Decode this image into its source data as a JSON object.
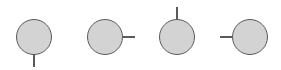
{
  "diagram": {
    "title": "",
    "fill_color": "#d3d3d3",
    "stroke_color": "#5a5a5a",
    "background": "#ffffff",
    "nodes": [
      {
        "id": "pin-bottom",
        "shape": "circle",
        "cx": 34,
        "cy": 37,
        "r": 18,
        "stick_direction": "down"
      },
      {
        "id": "pin-right",
        "shape": "circle",
        "cx": 105,
        "cy": 37,
        "r": 18,
        "stick_direction": "right"
      },
      {
        "id": "pin-top",
        "shape": "circle",
        "cx": 177,
        "cy": 37,
        "r": 18,
        "stick_direction": "up"
      },
      {
        "id": "pin-left",
        "shape": "circle",
        "cx": 250,
        "cy": 37,
        "r": 18,
        "stick_direction": "left"
      }
    ]
  }
}
